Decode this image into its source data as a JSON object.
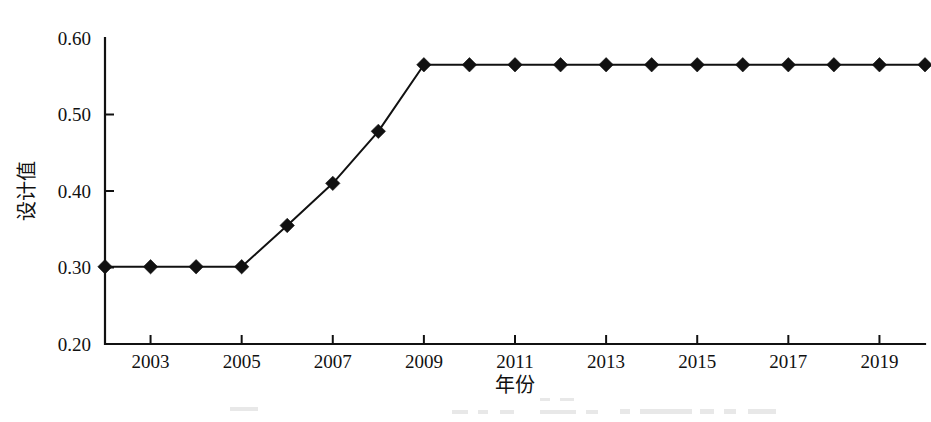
{
  "chart_data": {
    "type": "line",
    "title": "",
    "subtitle": "",
    "xlabel": "年份",
    "ylabel": "设计值",
    "xlim": [
      2002,
      2020
    ],
    "ylim": [
      0.2,
      0.6
    ],
    "grid": false,
    "legend": null,
    "legend_position": "none",
    "marker": "diamond",
    "line_color": "#111111",
    "marker_color": "#111111",
    "x": [
      2002,
      2003,
      2004,
      2005,
      2006,
      2007,
      2008,
      2009,
      2010,
      2011,
      2012,
      2013,
      2014,
      2015,
      2016,
      2017,
      2018,
      2019,
      2020
    ],
    "values": [
      0.301,
      0.301,
      0.301,
      0.301,
      0.355,
      0.41,
      0.478,
      0.565,
      0.565,
      0.565,
      0.565,
      0.565,
      0.565,
      0.565,
      0.565,
      0.565,
      0.565,
      0.565,
      0.565
    ],
    "series": [
      {
        "name": "设计值",
        "values": [
          0.301,
          0.301,
          0.301,
          0.301,
          0.355,
          0.41,
          0.478,
          0.565,
          0.565,
          0.565,
          0.565,
          0.565,
          0.565,
          0.565,
          0.565,
          0.565,
          0.565,
          0.565,
          0.565
        ]
      }
    ],
    "x_ticks": [
      2003,
      2005,
      2007,
      2009,
      2011,
      2013,
      2015,
      2017,
      2019
    ],
    "x_tick_labels": [
      "2003",
      "2005",
      "2007",
      "2009",
      "2011",
      "2013",
      "2015",
      "2017",
      "2019"
    ],
    "y_ticks": [
      0.2,
      0.3,
      0.4,
      0.5,
      0.6
    ],
    "y_tick_labels": [
      "0.20",
      "0.30",
      "0.40",
      "0.50",
      "0.60"
    ]
  },
  "axes": {
    "y_axis_title": "设计值",
    "x_axis_title": "年份"
  }
}
